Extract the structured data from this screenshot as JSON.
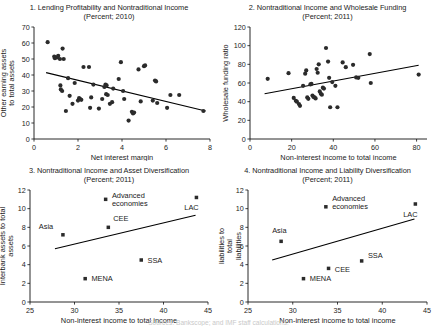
{
  "figure": {
    "footnote": "Sources: Bankscope; and IMF staff calculations."
  },
  "panels": [
    {
      "id": "panel-1",
      "title": "1. Lending Profitability and Nontraditional Income",
      "subtitle": "(Percent; 2010)",
      "chart_data": {
        "type": "scatter",
        "title": "1. Lending Profitability and Nontraditional Income",
        "subtitle": "(Percent; 2010)",
        "xlabel": "Net interest margin",
        "ylabel": "Other earning assets to total assets",
        "xlim": [
          0,
          8
        ],
        "ylim": [
          0,
          70
        ],
        "xticks": [
          0,
          2,
          4,
          6,
          8
        ],
        "yticks": [
          0,
          10,
          20,
          30,
          40,
          50,
          60,
          70
        ],
        "grid": false,
        "legend": "none",
        "trendline": {
          "x": [
            0.55,
            7.8
          ],
          "y": [
            41.5,
            17.5
          ],
          "slope": -3.31,
          "intercept": 43.3
        },
        "points": [
          [
            0.62,
            60.5
          ],
          [
            0.92,
            51.5
          ],
          [
            0.95,
            50.5
          ],
          [
            1.05,
            51.0
          ],
          [
            1.1,
            52.0
          ],
          [
            1.18,
            50.0
          ],
          [
            1.3,
            56.5
          ],
          [
            1.35,
            50.0
          ],
          [
            1.22,
            31.0
          ],
          [
            1.28,
            30.0
          ],
          [
            1.2,
            33.5
          ],
          [
            1.45,
            17.5
          ],
          [
            1.55,
            38.0
          ],
          [
            1.62,
            27.0
          ],
          [
            1.75,
            22.0
          ],
          [
            1.85,
            35.0
          ],
          [
            2.0,
            24.0
          ],
          [
            2.05,
            25.5
          ],
          [
            2.1,
            25.0
          ],
          [
            2.15,
            24.5
          ],
          [
            2.25,
            45.0
          ],
          [
            2.5,
            45.0
          ],
          [
            2.55,
            19.5
          ],
          [
            2.6,
            26.0
          ],
          [
            2.7,
            34.0
          ],
          [
            2.95,
            19.0
          ],
          [
            3.1,
            25.0
          ],
          [
            3.2,
            32.5
          ],
          [
            3.25,
            34.0
          ],
          [
            3.3,
            33.5
          ],
          [
            3.28,
            28.0
          ],
          [
            3.35,
            27.5
          ],
          [
            3.45,
            22.0
          ],
          [
            3.55,
            23.0
          ],
          [
            3.6,
            31.5
          ],
          [
            3.85,
            37.5
          ],
          [
            3.95,
            48.0
          ],
          [
            4.05,
            30.0
          ],
          [
            4.1,
            25.0
          ],
          [
            4.3,
            11.5
          ],
          [
            4.45,
            17.0
          ],
          [
            4.5,
            16.0
          ],
          [
            4.55,
            16.5
          ],
          [
            4.75,
            43.5
          ],
          [
            4.85,
            23.5
          ],
          [
            5.0,
            45.5
          ],
          [
            5.05,
            46.0
          ],
          [
            5.4,
            24.0
          ],
          [
            5.5,
            36.5
          ],
          [
            5.55,
            36.0
          ],
          [
            5.6,
            22.5
          ],
          [
            6.05,
            19.5
          ],
          [
            6.2,
            27.5
          ],
          [
            6.6,
            27.5
          ],
          [
            7.7,
            17.5
          ]
        ]
      }
    },
    {
      "id": "panel-2",
      "title": "2. Nontraditional Income and Wholesale Funding",
      "subtitle": "(Percent; 2011)",
      "chart_data": {
        "type": "scatter",
        "title": "2. Nontraditional Income and Wholesale Funding",
        "subtitle": "(Percent; 2011)",
        "xlabel": "Non-interest income to total income",
        "ylabel": "Wholesale funding ratio",
        "xlim": [
          0,
          85
        ],
        "ylim": [
          0,
          120
        ],
        "xticks": [
          0,
          20,
          40,
          60,
          80
        ],
        "yticks": [
          0,
          20,
          40,
          60,
          80,
          100,
          120
        ],
        "grid": false,
        "legend": "none",
        "trendline": {
          "x": [
            7.0,
            81.0
          ],
          "y": [
            48.5,
            79.0
          ],
          "slope": 0.412,
          "intercept": 45.6
        },
        "points": [
          [
            8.5,
            64.5
          ],
          [
            18.5,
            70.5
          ],
          [
            21.0,
            44.0
          ],
          [
            22.0,
            41.0
          ],
          [
            22.5,
            40.0
          ],
          [
            23.5,
            37.5
          ],
          [
            24.0,
            35.5
          ],
          [
            25.5,
            57.0
          ],
          [
            26.5,
            70.0
          ],
          [
            27.0,
            73.5
          ],
          [
            27.5,
            44.5
          ],
          [
            28.0,
            43.0
          ],
          [
            29.0,
            58.5
          ],
          [
            29.5,
            59.0
          ],
          [
            30.0,
            46.5
          ],
          [
            30.5,
            45.0
          ],
          [
            31.0,
            44.5
          ],
          [
            31.5,
            43.5
          ],
          [
            32.0,
            75.0
          ],
          [
            32.5,
            71.0
          ],
          [
            33.0,
            80.0
          ],
          [
            33.5,
            51.0
          ],
          [
            34.0,
            48.5
          ],
          [
            34.5,
            47.5
          ],
          [
            35.0,
            55.0
          ],
          [
            35.5,
            54.0
          ],
          [
            36.5,
            97.5
          ],
          [
            37.5,
            83.0
          ],
          [
            38.0,
            65.5
          ],
          [
            38.5,
            34.0
          ],
          [
            39.5,
            61.0
          ],
          [
            41.0,
            57.0
          ],
          [
            42.0,
            34.0
          ],
          [
            44.5,
            82.0
          ],
          [
            46.0,
            77.0
          ],
          [
            49.5,
            79.5
          ],
          [
            51.0,
            66.0
          ],
          [
            52.0,
            65.5
          ],
          [
            57.5,
            91.0
          ],
          [
            58.0,
            60.0
          ],
          [
            81.0,
            69.0
          ]
        ]
      }
    },
    {
      "id": "panel-3",
      "title": "3. Nontraditional Income and Asset Diversification",
      "subtitle": "(Percent; 2011)",
      "chart_data": {
        "type": "scatter",
        "title": "3. Nontraditional Income and Asset Diversification",
        "subtitle": "(Percent; 2011)",
        "xlabel": "Non-interest income to total income",
        "ylabel": "Interbank assets to total assets",
        "xlim": [
          25,
          45
        ],
        "ylim": [
          0,
          12
        ],
        "xticks": [
          25,
          30,
          35,
          40,
          45
        ],
        "yticks": [
          0,
          2,
          4,
          6,
          8,
          10,
          12
        ],
        "grid": false,
        "legend": "none",
        "trendline": {
          "x": [
            27.8,
            43.6
          ],
          "y": [
            5.7,
            9.3
          ],
          "slope": 0.228,
          "intercept": -0.63
        },
        "points": [
          {
            "label": "Asia",
            "x": 28.7,
            "y": 7.2,
            "label_dx": -1.9,
            "label_dy": 0.85,
            "anchor": "middle"
          },
          {
            "label": "MENA",
            "x": 31.2,
            "y": 2.5,
            "label_dx": 0.7,
            "label_dy": 0.0,
            "anchor": "start"
          },
          {
            "label": "Advanced economies",
            "x": 33.5,
            "y": 11.0,
            "label_dx": 0.7,
            "label_dy": 0.45,
            "anchor": "start"
          },
          {
            "label": "CEE",
            "x": 33.8,
            "y": 8.0,
            "label_dx": 0.55,
            "label_dy": 0.95,
            "anchor": "start"
          },
          {
            "label": "SSA",
            "x": 37.5,
            "y": 4.5,
            "label_dx": 0.7,
            "label_dy": 0.0,
            "anchor": "start"
          },
          {
            "label": "LAC",
            "x": 43.7,
            "y": 11.2,
            "label_dx": -0.55,
            "label_dy": -1.1,
            "anchor": "middle"
          }
        ]
      }
    },
    {
      "id": "panel-4",
      "title": "4. Nontraditional Income and Liability Diversification",
      "subtitle": "(Percent; 2011)",
      "chart_data": {
        "type": "scatter",
        "title": "4. Nontraditional Income and Liability Diversification",
        "subtitle": "(Percent; 2011)",
        "xlabel": "Non-interest income to total income",
        "ylabel": "Interbank liabilities to total liabilities",
        "xlim": [
          25,
          45
        ],
        "ylim": [
          0,
          12
        ],
        "xticks": [
          25,
          30,
          35,
          40,
          45
        ],
        "yticks": [
          0,
          2,
          4,
          6,
          8,
          10,
          12
        ],
        "grid": false,
        "legend": "none",
        "trendline": {
          "x": [
            27.7,
            43.6
          ],
          "y": [
            4.5,
            8.9
          ],
          "slope": 0.277,
          "intercept": -3.17
        },
        "points": [
          {
            "label": "Asia",
            "x": 28.7,
            "y": 6.5,
            "label_dx": -0.2,
            "label_dy": 1.15,
            "anchor": "middle"
          },
          {
            "label": "MENA",
            "x": 31.2,
            "y": 2.5,
            "label_dx": 0.7,
            "label_dy": 0.0,
            "anchor": "start"
          },
          {
            "label": "Advanced economies",
            "x": 33.7,
            "y": 10.2,
            "label_dx": 0.7,
            "label_dy": 0.9,
            "anchor": "start"
          },
          {
            "label": "CEE",
            "x": 34.0,
            "y": 3.6,
            "label_dx": 0.7,
            "label_dy": -0.15,
            "anchor": "start"
          },
          {
            "label": "SSA",
            "x": 37.7,
            "y": 4.4,
            "label_dx": 0.7,
            "label_dy": 0.55,
            "anchor": "start"
          },
          {
            "label": "LAC",
            "x": 43.7,
            "y": 10.5,
            "label_dx": -0.55,
            "label_dy": -1.1,
            "anchor": "middle"
          }
        ]
      }
    }
  ]
}
